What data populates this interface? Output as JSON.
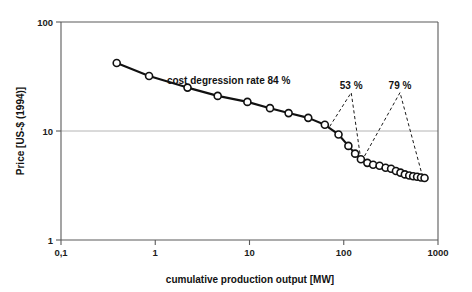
{
  "chart_data": {
    "type": "line",
    "title": "",
    "subtitle": "",
    "xlabel": "cumulative production output [MW]",
    "ylabel": "Price [US-$ (1994)]",
    "xscale": "log",
    "yscale": "log",
    "xlim": [
      0.1,
      1000
    ],
    "ylim": [
      1,
      100
    ],
    "xticks": [
      0.1,
      1,
      10,
      100,
      1000
    ],
    "xtick_labels": [
      "0,1",
      "1",
      "10",
      "100",
      "1000"
    ],
    "yticks": [
      1,
      10,
      100
    ],
    "ytick_labels": [
      "1",
      "10",
      "100"
    ],
    "grid": "horizontal-at-10",
    "legend": "none",
    "series": [
      {
        "name": "price vs cumulative production output",
        "marker": "open-circle",
        "points": [
          {
            "x": 0.39,
            "y": 42.0
          },
          {
            "x": 0.86,
            "y": 32.0
          },
          {
            "x": 2.2,
            "y": 25.0
          },
          {
            "x": 4.6,
            "y": 21.0
          },
          {
            "x": 9.5,
            "y": 18.5
          },
          {
            "x": 16.5,
            "y": 16.2
          },
          {
            "x": 26.0,
            "y": 14.6
          },
          {
            "x": 42.0,
            "y": 13.2
          },
          {
            "x": 63.0,
            "y": 11.4
          },
          {
            "x": 88.0,
            "y": 9.3
          },
          {
            "x": 112.0,
            "y": 7.3
          },
          {
            "x": 132.0,
            "y": 6.2
          },
          {
            "x": 152.0,
            "y": 5.5
          },
          {
            "x": 178.0,
            "y": 5.1
          },
          {
            "x": 205.0,
            "y": 4.9
          },
          {
            "x": 240.0,
            "y": 4.8
          },
          {
            "x": 278.0,
            "y": 4.6
          },
          {
            "x": 318.0,
            "y": 4.5
          },
          {
            "x": 358.0,
            "y": 4.3
          },
          {
            "x": 400.0,
            "y": 4.15
          },
          {
            "x": 445.0,
            "y": 4.0
          },
          {
            "x": 495.0,
            "y": 3.9
          },
          {
            "x": 545.0,
            "y": 3.85
          },
          {
            "x": 600.0,
            "y": 3.8
          },
          {
            "x": 660.0,
            "y": 3.75
          },
          {
            "x": 720.0,
            "y": 3.7
          }
        ]
      }
    ],
    "annotations": [
      {
        "id": "degression-84",
        "text": "cost degression rate 84 %",
        "kind": "inline-text",
        "x": 6.0,
        "y": 27.0
      },
      {
        "id": "segment-53",
        "text": "53 %",
        "kind": "bracket-label",
        "apex": {
          "x": 120.0,
          "y": 24.5
        },
        "left_end": {
          "x": 71.0,
          "y": 11.0
        },
        "right_end": {
          "x": 152.0,
          "y": 5.4
        }
      },
      {
        "id": "segment-79",
        "text": "79 %",
        "kind": "bracket-label",
        "apex": {
          "x": 395.0,
          "y": 24.5
        },
        "left_end": {
          "x": 155.0,
          "y": 5.3
        },
        "right_end": {
          "x": 690.0,
          "y": 3.75
        }
      }
    ]
  },
  "colors": {
    "line": "#111111",
    "marker_fill": "#ffffff",
    "marker_stroke": "#111111",
    "axis": "#5a5a5a",
    "grid": "#b4b4b4",
    "text": "#121212",
    "background": "#ffffff"
  }
}
